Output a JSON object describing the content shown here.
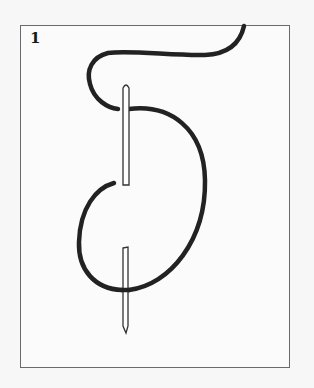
{
  "figure": {
    "step_number": "1",
    "colors": {
      "thread": "#222222",
      "needle_outline": "#333333",
      "needle_fill": "#ffffff",
      "frame_border": "#6a6a6a",
      "background": "#fbfbfb"
    }
  }
}
